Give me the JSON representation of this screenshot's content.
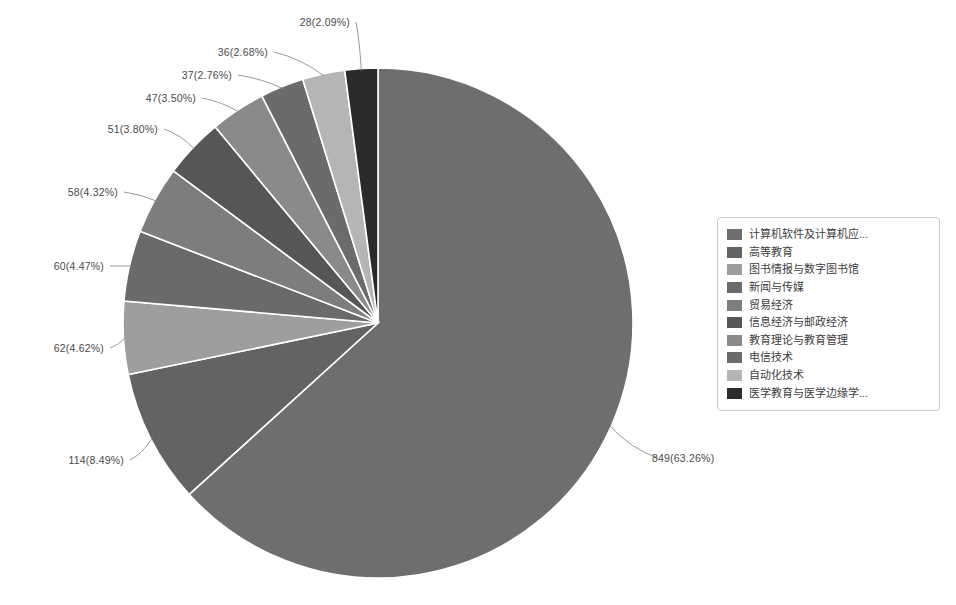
{
  "chart_data": {
    "type": "pie",
    "title": "",
    "subtitle": "",
    "xlabel": "",
    "ylabel": "",
    "legend_position": "right",
    "grid": false,
    "total": 1342,
    "start_angle_deg": 0,
    "direction": "clockwise",
    "categories": [
      "计算机软件及计算机应...",
      "高等教育",
      "图书情报与数字图书馆",
      "新闻与传媒",
      "贸易经济",
      "信息经济与邮政经济",
      "教育理论与教育管理",
      "电信技术",
      "自动化技术",
      "医学教育与医学边缘学..."
    ],
    "values": [
      849,
      114,
      62,
      60,
      58,
      51,
      47,
      37,
      36,
      28
    ],
    "percents": [
      63.26,
      8.49,
      4.62,
      4.47,
      4.32,
      3.8,
      3.5,
      2.76,
      2.68,
      2.09
    ],
    "data_labels": [
      "849(63.26%)",
      "114(8.49%)",
      "62(4.62%)",
      "60(4.47%)",
      "58(4.32%)",
      "51(3.80%)",
      "47(3.50%)",
      "37(2.76%)",
      "36(2.68%)",
      "28(2.09%)"
    ],
    "colors": [
      "#6e6e6e",
      "#636363",
      "#9e9e9e",
      "#6a6a6a",
      "#7d7d7d",
      "#565656",
      "#8a8a8a",
      "#6b6b6b",
      "#b5b5b5",
      "#2b2b2b"
    ]
  },
  "legend": {
    "items": [
      {
        "label": "计算机软件及计算机应...",
        "color": "#6e6e6e"
      },
      {
        "label": "高等教育",
        "color": "#636363"
      },
      {
        "label": "图书情报与数字图书馆",
        "color": "#9e9e9e"
      },
      {
        "label": "新闻与传媒",
        "color": "#6a6a6a"
      },
      {
        "label": "贸易经济",
        "color": "#7d7d7d"
      },
      {
        "label": "信息经济与邮政经济",
        "color": "#565656"
      },
      {
        "label": "教育理论与教育管理",
        "color": "#8a8a8a"
      },
      {
        "label": "电信技术",
        "color": "#6b6b6b"
      },
      {
        "label": "自动化技术",
        "color": "#b5b5b5"
      },
      {
        "label": "医学教育与医学边缘学...",
        "color": "#2b2b2b"
      }
    ]
  },
  "labels": {
    "l0": "849(63.26%)",
    "l1": "114(8.49%)",
    "l2": "62(4.62%)",
    "l3": "60(4.47%)",
    "l4": "58(4.32%)",
    "l5": "51(3.80%)",
    "l6": "47(3.50%)",
    "l7": "37(2.76%)",
    "l8": "36(2.68%)",
    "l9": "28(2.09%)"
  },
  "style": {
    "background": "#ffffff",
    "slice_border": "#ffffff",
    "leader_color": "#8d8d8d",
    "label_color": "#4a4a4a",
    "legend_border": "#c9c9c9"
  }
}
